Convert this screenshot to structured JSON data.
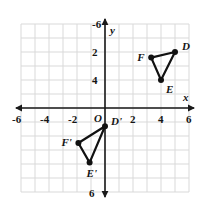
{
  "chart_data": {
    "type": "scatter",
    "title": "",
    "xlabel": "x",
    "ylabel": "y",
    "xlim": [
      -6,
      6
    ],
    "ylim": [
      -6,
      6
    ],
    "grid": true,
    "grid_step": 1,
    "legend": "none",
    "origin_label": "O",
    "xticks": [
      -6,
      -4,
      -2,
      2,
      4,
      6
    ],
    "xtick_labels": [
      "-6",
      "-4",
      "-2",
      "2",
      "4",
      "6"
    ],
    "yticks": [
      -6,
      -2,
      2,
      4,
      6
    ],
    "ytick_labels": [
      "-6",
      "2",
      "4",
      "6"
    ],
    "ytick_values_shown": [
      6,
      4,
      2,
      -6
    ],
    "series": [
      {
        "name": "Triangle DEF",
        "closed": true,
        "points": [
          {
            "label": "D",
            "x": 5,
            "y": 4,
            "label_dx": 7,
            "label_dy": -11
          },
          {
            "label": "E",
            "x": 4,
            "y": 2,
            "label_dx": 5,
            "label_dy": 4
          },
          {
            "label": "F",
            "x": 3.3,
            "y": 3.6,
            "label_dx": -14,
            "label_dy": -6
          }
        ]
      },
      {
        "name": "Triangle D'E'F'",
        "closed": true,
        "points": [
          {
            "label": "D'",
            "x": 0,
            "y": -1.3,
            "label_dx": 6,
            "label_dy": -10
          },
          {
            "label": "E'",
            "x": -1.1,
            "y": -3.9,
            "label_dx": -3,
            "label_dy": 5
          },
          {
            "label": "F'",
            "x": -1.9,
            "y": -2.5,
            "label_dx": -17,
            "label_dy": -6
          }
        ]
      }
    ]
  },
  "colors": {
    "grid": "#d9d9d9",
    "axis": "#1a1a1a",
    "shape_stroke": "#111111",
    "point_fill": "#111111",
    "background": "#ffffff"
  },
  "axes": {
    "x_axis_name": "x",
    "y_axis_name": "y"
  }
}
